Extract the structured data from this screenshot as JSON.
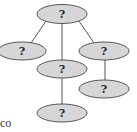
{
  "diagram": {
    "type": "tree",
    "node_fill": "#d6d6d6",
    "node_stroke": "#555555",
    "edge_color": "#555555",
    "nodes": [
      {
        "id": "root",
        "label": "?",
        "cx": 62,
        "cy": 14,
        "rx": 25,
        "ry": 9.5
      },
      {
        "id": "left-child",
        "label": "?",
        "cx": 22,
        "cy": 51,
        "rx": 24,
        "ry": 9
      },
      {
        "id": "middle-child",
        "label": "?",
        "cx": 62,
        "cy": 69,
        "rx": 25,
        "ry": 9
      },
      {
        "id": "right-child",
        "label": "?",
        "cx": 104,
        "cy": 51,
        "rx": 25,
        "ry": 9
      },
      {
        "id": "middle-grandchild",
        "label": "?",
        "cx": 62,
        "cy": 113,
        "rx": 25,
        "ry": 9
      },
      {
        "id": "right-grandchild",
        "label": "?",
        "cx": 104,
        "cy": 89,
        "rx": 25,
        "ry": 9
      }
    ],
    "edges": [
      {
        "from": "root",
        "to": "left-child"
      },
      {
        "from": "root",
        "to": "middle-child"
      },
      {
        "from": "root",
        "to": "right-child"
      },
      {
        "from": "middle-child",
        "to": "middle-grandchild"
      },
      {
        "from": "right-child",
        "to": "right-grandchild"
      }
    ]
  },
  "text_fragment": "co"
}
